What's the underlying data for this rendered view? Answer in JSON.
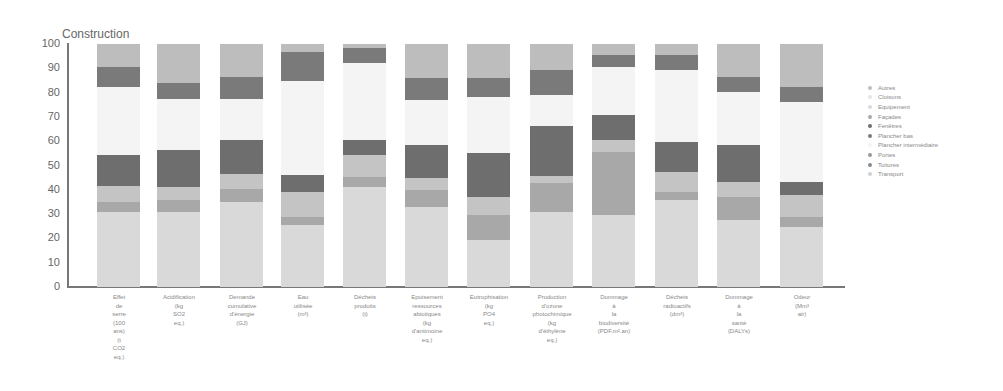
{
  "chart_data": {
    "type": "bar",
    "stacked": true,
    "title": "Construction",
    "xlabel": "",
    "ylabel": "",
    "ylim": [
      0,
      100
    ],
    "yticks": [
      0,
      10,
      20,
      30,
      40,
      50,
      60,
      70,
      80,
      90,
      100
    ],
    "grid": false,
    "legend_position": "right",
    "categories": [
      "Effet de serre (100 ans) (t CO2 eq.)",
      "Acidification (kg SO2 eq.)",
      "Demande cumulative d'énergie (GJ)",
      "Eau utilisée (m³)",
      "Déchets produits (t)",
      "Epuisement ressources abiotiques (kg d'antimoine eq.)",
      "Eutrophisation (kg PO4 eq.)",
      "Production d'ozone photochimique (kg d'éthylène eq.)",
      "Dommage à la biodiversité (PDF.m².an)",
      "Déchets radioactifs (dm³)",
      "Dommage à la santé (DALYs)",
      "Odeur (Mm³ air)"
    ],
    "series": [
      {
        "name": "Equipement",
        "color": "#d9d9d9",
        "values": [
          31,
          31,
          35,
          25.5,
          41.3,
          33,
          19.3,
          31,
          29.6,
          35.8,
          27.6,
          24.8
        ]
      },
      {
        "name": "Façades",
        "color": "#a8a8a8",
        "values": [
          4.1,
          4.8,
          5.5,
          3.4,
          4.1,
          6.9,
          10.3,
          11.7,
          26.1,
          3.4,
          9.6,
          4.1
        ]
      },
      {
        "name": "Cloisons",
        "color": "#c4c4c4",
        "values": [
          6.6,
          5.5,
          6.2,
          10.3,
          8.9,
          4.8,
          7.6,
          3,
          4.8,
          8.2,
          6.1,
          9
        ]
      },
      {
        "name": "Fenêtres",
        "color": "#6e6e6e",
        "values": [
          12.6,
          15.1,
          14,
          6.9,
          6.2,
          13.7,
          17.8,
          20.6,
          10.3,
          12.4,
          15.1,
          5.4
        ]
      },
      {
        "name": "Plancher intermédiaire",
        "color": "#f4f4f4",
        "values": [
          28.1,
          20.8,
          16.8,
          38.8,
          31.6,
          18.6,
          23.3,
          12.7,
          19.9,
          29.5,
          22,
          33
        ]
      },
      {
        "name": "Plancher bas",
        "color": "#7a7a7a",
        "values": [
          8.2,
          6.6,
          8.9,
          11.9,
          6.1,
          8.9,
          7.6,
          10.3,
          4.8,
          6.2,
          6.1,
          6.1
        ]
      },
      {
        "name": "Autres",
        "color": "#bdbdbd",
        "values": [
          9.4,
          16.2,
          13.5,
          3.2,
          1.8,
          14.1,
          14.1,
          10.7,
          4.5,
          4.5,
          13.5,
          17.6
        ]
      }
    ],
    "legend": [
      "Autres",
      "Cloisons",
      "Equipement",
      "Façades",
      "Fenêtres",
      "Plancher bas",
      "Plancher intermédiaire",
      "Portes",
      "Toitures",
      "Transport"
    ]
  },
  "labels": [
    "Effet\nde\nserre\n(100\nans)\n(t\nCO2\neq.)",
    "Acidification\n(kg\nSO2\neq.)",
    "Demande\ncumulative\nd'énergie\n(GJ)",
    "Eau\nutilisée\n(m³)",
    "Déchets\nproduits\n(t)",
    "Epuisement\nressources\nabiotiques\n(kg\nd'antimoine\neq.)",
    "Eutrophisation\n(kg\nPO4\neq.)",
    "Production\nd'ozone\nphotochimique\n(kg\nd'éthylène\neq.)",
    "Dommage\nà\nla\nbiodiversité\n(PDF.m².an)",
    "Déchets\nradioactifs\n(dm³)",
    "Dommage\nà\nla\nsanté\n(DALYs)",
    "Odeur\n(Mm³\nair)"
  ],
  "legend_colors": [
    "#bdbdbd",
    "#e6e6e6",
    "#d9d9d9",
    "#a8a8a8",
    "#6e6e6e",
    "#7a7a7a",
    "#f4f4f4",
    "#999999",
    "#8a8a8a",
    "#cfcfcf"
  ]
}
